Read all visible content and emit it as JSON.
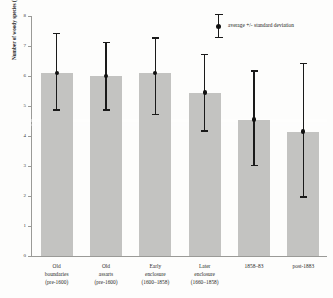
{
  "chart_data": {
    "type": "bar",
    "title": "",
    "xlabel": "",
    "ylabel": "Number of woody species (µm density)",
    "ylim": [
      0,
      8
    ],
    "yticks": [
      0,
      1,
      2,
      3,
      4,
      5,
      6,
      7,
      8
    ],
    "grid": false,
    "legend_position": "top-right",
    "legend": [
      "average +/- standard deviation"
    ],
    "categories": [
      "Old boundaries (pre-1600)",
      "Old assarts (pre-1600)",
      "Early enclosure (1600–1858)",
      "Later enclosure (1660–1858)",
      "1858–83",
      "post-1883"
    ],
    "category_lines": [
      [
        "Old",
        "boundaries",
        "(pre-1600)"
      ],
      [
        "Old",
        "assarts",
        "(pre-1600)"
      ],
      [
        "Early",
        "enclosure",
        "(1600–1858)"
      ],
      [
        "Later",
        "enclosure",
        "(1660–1858)"
      ],
      [
        "1858–83"
      ],
      [
        "post-1883"
      ]
    ],
    "values": [
      6.1,
      6.0,
      6.1,
      5.45,
      4.55,
      4.15
    ],
    "errors_upper": [
      7.4,
      7.1,
      7.25,
      6.7,
      6.15,
      6.4
    ],
    "errors_lower": [
      4.85,
      4.85,
      4.7,
      4.15,
      3.0,
      1.95
    ],
    "series": [
      {
        "name": "average +/- standard deviation",
        "values": [
          6.1,
          6.0,
          6.1,
          5.45,
          4.55,
          4.15
        ],
        "err_upper": [
          7.4,
          7.1,
          7.25,
          6.7,
          6.15,
          6.4
        ],
        "err_lower": [
          4.85,
          4.85,
          4.7,
          4.15,
          3.0,
          1.95
        ]
      }
    ],
    "colors": {
      "bar": "#c3c3c1",
      "marker": "#111111",
      "error_bar": "#1a1a1a",
      "axis": "#9a9a97",
      "background": "#fdfdfc"
    }
  },
  "legend": {
    "label": "average +/- standard deviation"
  },
  "axes": {
    "y_title": "Number of woody species (µm density)",
    "y_tick_labels": [
      "8",
      "7",
      "6",
      "5",
      "4",
      "3",
      "2",
      "1",
      "0"
    ]
  }
}
